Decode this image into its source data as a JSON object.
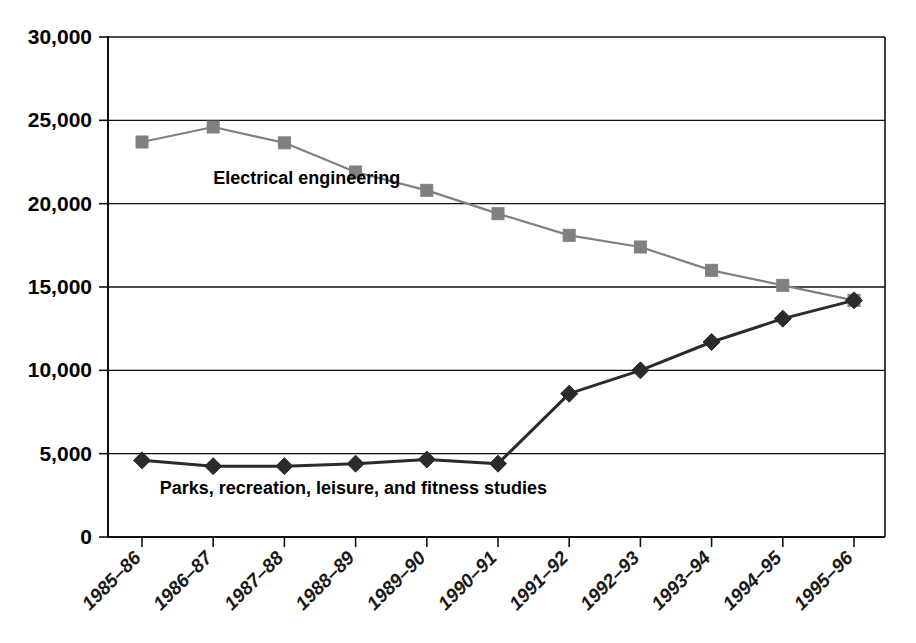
{
  "chart_data": {
    "type": "line",
    "title": "",
    "subtitle": "",
    "xlabel": "",
    "ylabel": "",
    "categories": [
      "1985–86",
      "1986–87",
      "1987–88",
      "1988–89",
      "1989–90",
      "1990–91",
      "1991–92",
      "1992–93",
      "1993–94",
      "1994–95",
      "1995–96"
    ],
    "series": [
      {
        "name": "Electrical engineering",
        "marker": "square",
        "color": "#808080",
        "values": [
          23700,
          24600,
          23650,
          21900,
          20800,
          19400,
          18100,
          17400,
          16000,
          15100,
          14200
        ]
      },
      {
        "name": "Parks, recreation, leisure, and fitness studies",
        "marker": "diamond",
        "color": "#2b2b2b",
        "values": [
          4600,
          4250,
          4250,
          4400,
          4650,
          4400,
          8600,
          10000,
          11700,
          13100,
          14200
        ]
      }
    ],
    "ylim": [
      0,
      30000
    ],
    "ytick_values": [
      0,
      5000,
      10000,
      15000,
      20000,
      25000,
      30000
    ],
    "ytick_labels": [
      "0",
      "5,000",
      "10,000",
      "15,000",
      "20,000",
      "25,000",
      "30,000"
    ],
    "grid": true,
    "grid_axis": "y",
    "legend": "none",
    "annotations": [
      {
        "name": "electrical-engineering-label",
        "text": "Electrical engineering",
        "x": 1.0,
        "y": 21200
      },
      {
        "name": "parks-label",
        "text": "Parks, recreation, leisure, and fitness studies",
        "x": 0.25,
        "y": 2600
      }
    ],
    "axis_colors": {
      "axis": "#111111",
      "grid": "#111111",
      "background": "#ffffff"
    }
  }
}
